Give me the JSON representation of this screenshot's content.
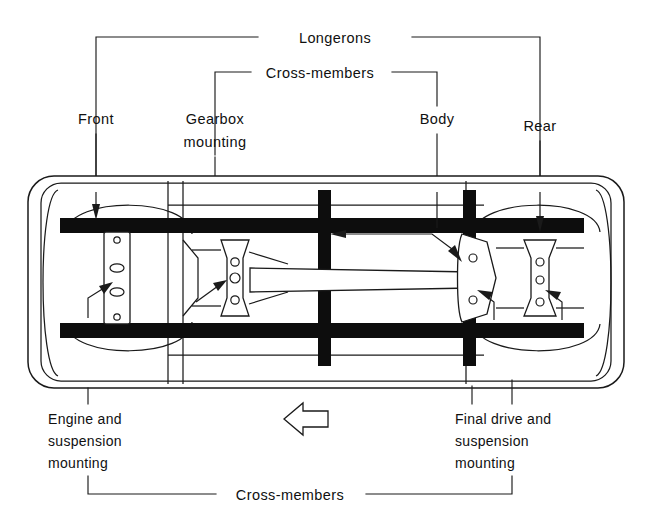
{
  "figure": {
    "type": "technical-diagram",
    "background_color": "#ffffff",
    "ink_color": "#1a1a1a"
  },
  "top_brackets": [
    {
      "id": "longerons",
      "label": "Longerons",
      "label_x": 335,
      "label_y": 43,
      "bar_y": 37,
      "left_x": 96,
      "right_x": 540,
      "left_drop_to": 188,
      "right_drop_to": 188
    },
    {
      "id": "cross-members-top",
      "label": "Cross-members",
      "label_x": 320,
      "label_y": 78,
      "bar_y": 72,
      "left_x": 215,
      "right_x": 437,
      "left_drop_to": 188,
      "right_drop_to": 188
    }
  ],
  "top_labels": [
    {
      "id": "front",
      "lines": [
        "Front"
      ],
      "x": 96,
      "y": 120,
      "anchor": "middle",
      "leader_x": 96,
      "leader_top": 130,
      "leader_bottom": 192
    },
    {
      "id": "gearbox",
      "lines": [
        "Gearbox",
        "mounting"
      ],
      "x": 215,
      "y": 120,
      "anchor": "middle",
      "leader_x": 215,
      "leader_top": 152,
      "leader_bottom": 192
    },
    {
      "id": "body",
      "lines": [
        "Body"
      ],
      "x": 437,
      "y": 120,
      "anchor": "middle",
      "leader_x": 437,
      "leader_top": 130,
      "leader_bottom": 192
    },
    {
      "id": "rear",
      "lines": [
        "Rear"
      ],
      "x": 540,
      "y": 128,
      "anchor": "middle",
      "leader_x": 540,
      "leader_top": 138,
      "leader_bottom": 192
    }
  ],
  "bottom_labels": [
    {
      "id": "engine-and-suspension-mounting",
      "lines": [
        "Engine and",
        "suspension",
        "mounting"
      ],
      "x": 48,
      "y": 421,
      "anchor": "start",
      "leaders": [
        {
          "x": 88,
          "top": 388,
          "bottom": 406
        }
      ],
      "tail": {
        "x": 88,
        "top": 452,
        "bottom": 484
      }
    },
    {
      "id": "final-drive-and-suspension-mounting",
      "lines": [
        "Final drive and",
        "suspension",
        "mounting"
      ],
      "x": 455,
      "y": 421,
      "anchor": "start",
      "leaders": [
        {
          "x": 472,
          "top": 386,
          "bottom": 404
        },
        {
          "x": 512,
          "top": 382,
          "bottom": 404
        }
      ],
      "tail": {
        "x": 512,
        "top": 452,
        "bottom": 484
      }
    }
  ],
  "bottom_bracket": {
    "id": "cross-members-bottom",
    "label": "Cross-members",
    "label_x": 290,
    "label_y": 500,
    "bar_y": 494,
    "left_x": 88,
    "right_x": 512
  },
  "direction_arrow": {
    "id": "direction-of-travel-arrow",
    "points": "284,419 303,403 303,411 328,411 328,427 303,427 303,435",
    "description": "hollow arrow pointing left indicating forward direction"
  },
  "chassis": {
    "outer_body": {
      "x": 28,
      "y": 176,
      "width": 596,
      "height": 212,
      "rx": 26,
      "description": "rounded outer body shell outline"
    },
    "inner_shell": {
      "x": 41,
      "y": 183,
      "width": 570,
      "height": 198,
      "rx": 20
    },
    "longeron_top": {
      "x": 168,
      "y": 186,
      "width": 316,
      "height": 6
    },
    "longeron_bottom": {
      "x": 168,
      "y": 372,
      "width": 316,
      "height": 6
    },
    "cross_member_front": {
      "x": 60,
      "y": 218,
      "width": 524,
      "height": 16,
      "label": "front cross-member"
    },
    "cross_member_rear": {
      "x": 60,
      "y": 322,
      "width": 524,
      "height": 16,
      "label": "rear cross-member"
    },
    "longeron_left_rail": {
      "x": 318,
      "y": 218,
      "width": 14,
      "height": 120
    },
    "longeron_right_rail": {
      "x": 466,
      "y": 218,
      "width": 14,
      "height": 120
    },
    "wheel_arch_front_top": {
      "cx": 128,
      "cy": 232,
      "rx": 62,
      "ry": 48
    },
    "wheel_arch_front_bottom": {
      "cx": 128,
      "cy": 324,
      "rx": 62,
      "ry": 48
    },
    "wheel_arch_rear_top": {
      "cx": 538,
      "cy": 232,
      "rx": 62,
      "ry": 48
    },
    "wheel_arch_rear_bottom": {
      "cx": 538,
      "cy": 324,
      "rx": 62,
      "ry": 48
    },
    "engine_mount_plate": {
      "x": 104,
      "y": 232,
      "width": 25,
      "height": 92,
      "holes": 4,
      "label": "engine and suspension mounting plate"
    },
    "gearbox_mount": {
      "cx": 235,
      "cy": 278,
      "label": "gearbox mounting dog-bone bracket",
      "holes": 3
    },
    "final_drive_plate": {
      "cx": 474,
      "cy": 278,
      "label": "final drive mounting plate",
      "holes": 2
    },
    "rear_suspension_mount": {
      "cx": 540,
      "cy": 278,
      "label": "rear suspension mounting bracket",
      "holes": 3
    },
    "propshaft_tunnel": {
      "x": 250,
      "y": 270,
      "width": 228,
      "height": 16,
      "label": "propeller shaft tunnel"
    }
  },
  "callout_arrows": [
    {
      "id": "front-arrow",
      "path": "M96,190 L96,216",
      "head": "96,224 91,208 101,208",
      "target": "front cross-member"
    },
    {
      "id": "rear-arrow",
      "path": "M540,190 L540,228",
      "head": "540,238 535,220 545,220",
      "target": "rear cross-member"
    },
    {
      "id": "body-arrow-left",
      "path": "M340,234 L430,234",
      "head": "330,234 346,229 346,239",
      "target": "body shell panel"
    },
    {
      "id": "body-arrow-right",
      "path": "M432,232 L452,258",
      "head": "458,266 446,254 454,249",
      "target": "body shell right"
    },
    {
      "id": "gearbox-arrow",
      "path": "M196,300 L222,284",
      "head": "230,279 216,281 221,291",
      "target": "gearbox mounting"
    },
    {
      "id": "engine-mount-arrow",
      "path": "M90,318 L90,300 L110,288",
      "head": "118,283 104,285 109,295",
      "target": "engine mounting plate"
    },
    {
      "id": "final-drive-arrow",
      "path": "M488,320 L488,302 L478,294",
      "head": "470,289 481,300 486,291",
      "target": "final drive plate"
    },
    {
      "id": "rear-mount-arrow",
      "path": "M556,320 L556,302 L548,294",
      "head": "540,289 551,300 556,291",
      "target": "rear suspension mounting"
    }
  ]
}
